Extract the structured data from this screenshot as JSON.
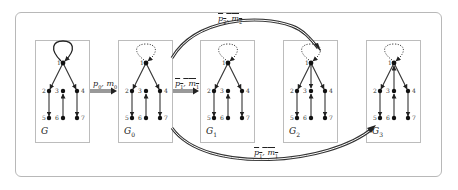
{
  "diagram": {
    "type": "graph-transformation",
    "panels": [
      {
        "id": "G",
        "label": "G",
        "subscript": "",
        "x": 35,
        "loop": "solid"
      },
      {
        "id": "G0",
        "label": "G",
        "subscript": "0",
        "x": 118,
        "loop": "dotted"
      },
      {
        "id": "G1",
        "label": "G",
        "subscript": "1",
        "x": 200,
        "loop": "dotted"
      },
      {
        "id": "G2",
        "label": "G",
        "subscript": "2",
        "x": 283,
        "loop": "dotted"
      },
      {
        "id": "G3",
        "label": "G",
        "subscript": "3",
        "x": 366,
        "loop": "dotted"
      }
    ],
    "nodes": [
      "1",
      "2",
      "3",
      "4",
      "5",
      "6",
      "7"
    ],
    "edges_common": [
      {
        "from": "1",
        "to": "2"
      },
      {
        "from": "1",
        "to": "4"
      },
      {
        "from": "2",
        "to": "5"
      },
      {
        "from": "4",
        "to": "7"
      },
      {
        "from": "6",
        "to": "3"
      }
    ],
    "transitions": [
      {
        "from": "G",
        "to": "G0",
        "label": "p0, m0",
        "style": "straight"
      },
      {
        "from": "G0",
        "to": "G1",
        "label": "p1, m1",
        "style": "straight"
      },
      {
        "from": "G0",
        "to": "G2",
        "label": "p2, m2",
        "style": "curved-top"
      },
      {
        "from": "G0",
        "to": "G3",
        "label": "p1, m1",
        "style": "curved-bottom"
      }
    ],
    "labels": {
      "t0": {
        "p": "p",
        "ps": "0",
        "m": "m",
        "ms": "0"
      },
      "t1": {
        "p": "p",
        "ps": "1",
        "m": "m",
        "ms": "1"
      },
      "t2": {
        "p": "p",
        "ps": "2",
        "m": "m",
        "ms": "2"
      },
      "t3": {
        "p": "p",
        "ps": "1",
        "m": "m",
        "ms": "1"
      }
    },
    "colors": {
      "edge": "#222222",
      "border": "#bcbcbc",
      "frame": "#b8b8b8"
    }
  }
}
